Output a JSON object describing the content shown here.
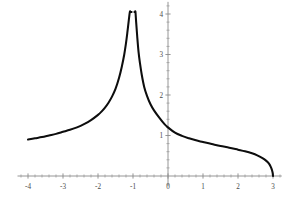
{
  "chart_data": {
    "type": "line",
    "title": "",
    "subtitle": "",
    "xlabel": "",
    "ylabel": "",
    "xlim": [
      -4.3,
      3.25
    ],
    "ylim": [
      -0.25,
      4.3
    ],
    "grid": false,
    "legend": null,
    "axis_style": "cross-hair axes through origin, gray",
    "curve_color": "#0d0d0d",
    "axis_color": "#8a8a8a",
    "background": "#ffffff",
    "x_ticks_major": [
      -4,
      -3,
      -2,
      -1,
      0,
      1,
      2,
      3
    ],
    "x_tick_labels": [
      "-4",
      "-3",
      "-2",
      "-1",
      "0",
      "1",
      "2",
      "3"
    ],
    "x_ticks_minor_step": 0.2,
    "y_ticks_major": [
      1,
      2,
      3,
      4
    ],
    "y_tick_labels": [
      "1",
      "2",
      "3",
      "4"
    ],
    "y_ticks_minor_step": 0.2,
    "asymptote_x": -1,
    "peak_value_clipped_at": 4,
    "x_intercept": 3,
    "y_intercept": 1.1,
    "annotations": [],
    "series": [
      {
        "name": "curve",
        "comment": "Left branch: x from -4 to -1, rising to vertical asymptote at x=-1",
        "x": [
          -4.0,
          -3.8,
          -3.6,
          -3.4,
          -3.2,
          -3.0,
          -2.8,
          -2.6,
          -2.4,
          -2.2,
          -2.0,
          -1.9,
          -1.8,
          -1.7,
          -1.6,
          -1.5,
          -1.4,
          -1.32,
          -1.25,
          -1.2,
          -1.16,
          -1.12,
          -1.09,
          -1.07,
          -1.055,
          -1.045,
          -1.04
        ],
        "y": [
          0.9,
          0.93,
          0.96,
          1.0,
          1.04,
          1.09,
          1.14,
          1.2,
          1.28,
          1.38,
          1.51,
          1.59,
          1.69,
          1.81,
          1.96,
          2.15,
          2.42,
          2.7,
          3.0,
          3.28,
          3.55,
          3.85,
          4.05,
          4.05,
          4.05,
          4.05,
          4.05
        ]
      },
      {
        "name": "curve",
        "comment": "Right branch: x from -1 to 3, falling from vertical asymptote to zero at x=3",
        "x": [
          -0.96,
          -0.955,
          -0.945,
          -0.93,
          -0.91,
          -0.88,
          -0.84,
          -0.8,
          -0.75,
          -0.68,
          -0.6,
          -0.5,
          -0.4,
          -0.25,
          -0.1,
          0.0,
          0.2,
          0.4,
          0.6,
          0.8,
          1.0,
          1.25,
          1.5,
          1.75,
          2.0,
          2.2,
          2.4,
          2.55,
          2.7,
          2.8,
          2.88,
          2.94,
          2.97,
          2.99,
          3.0
        ],
        "y": [
          4.05,
          4.05,
          4.05,
          4.05,
          3.8,
          3.45,
          3.05,
          2.78,
          2.5,
          2.2,
          1.98,
          1.77,
          1.62,
          1.44,
          1.28,
          1.2,
          1.07,
          0.99,
          0.93,
          0.88,
          0.84,
          0.79,
          0.74,
          0.7,
          0.65,
          0.61,
          0.56,
          0.51,
          0.44,
          0.38,
          0.31,
          0.22,
          0.15,
          0.08,
          0.0
        ]
      }
    ]
  },
  "figure": {
    "kind_label": "function-plot",
    "width_px": 288,
    "height_px": 200
  }
}
